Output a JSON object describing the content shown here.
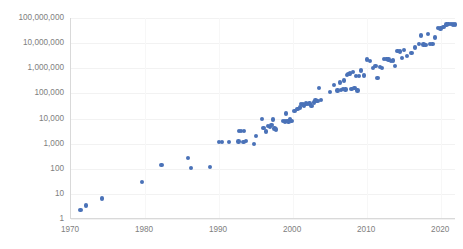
{
  "chart_data": {
    "type": "scatter",
    "title": "",
    "subtitle": "",
    "xlabel": "",
    "ylabel": "",
    "xlim": [
      1970,
      2022
    ],
    "ylim": [
      1,
      100000000
    ],
    "yscale": "log",
    "xscale": "linear",
    "grid": true,
    "legend": false,
    "legend_position": "none",
    "series_color": "#4a72b8",
    "marker": "circle",
    "xticks": [
      1970,
      1980,
      1990,
      2000,
      2010,
      2020
    ],
    "xtick_labels": [
      "1970",
      "1980",
      "1990",
      "2000",
      "2010",
      "2020"
    ],
    "yticks": [
      1,
      10,
      100,
      1000,
      10000,
      100000,
      1000000,
      10000000,
      100000000
    ],
    "ytick_labels": [
      "1",
      "10",
      "100",
      "1,000",
      "10,000",
      "100,000",
      "1,000,000",
      "10,000,000",
      "100,000,000"
    ],
    "series": [
      {
        "name": "series-1",
        "points": [
          [
            1971.3,
            2.3
          ],
          [
            1972.0,
            3.5
          ],
          [
            1974.2,
            6.5
          ],
          [
            1979.6,
            29
          ],
          [
            1982.2,
            140
          ],
          [
            1985.8,
            275
          ],
          [
            1986.2,
            110
          ],
          [
            1988.8,
            120
          ],
          [
            1990.0,
            1180
          ],
          [
            1990.4,
            1180
          ],
          [
            1991.3,
            1180
          ],
          [
            1992.6,
            1200
          ],
          [
            1992.7,
            3100
          ],
          [
            1993.0,
            3100
          ],
          [
            1993.3,
            1150
          ],
          [
            1993.4,
            3100
          ],
          [
            1993.6,
            1300
          ],
          [
            1994.7,
            950
          ],
          [
            1995.0,
            2000
          ],
          [
            1995.8,
            9800
          ],
          [
            1996.0,
            4200
          ],
          [
            1996.3,
            3000
          ],
          [
            1996.6,
            5100
          ],
          [
            1996.9,
            4500
          ],
          [
            1997.1,
            5600
          ],
          [
            1997.3,
            9200
          ],
          [
            1997.5,
            4000
          ],
          [
            1997.7,
            3700
          ],
          [
            1998.6,
            8000
          ],
          [
            1998.9,
            7600
          ],
          [
            1999.0,
            16000
          ],
          [
            1999.2,
            8000
          ],
          [
            1999.4,
            7600
          ],
          [
            1999.6,
            9000
          ],
          [
            1999.8,
            8000
          ],
          [
            2000.2,
            20000
          ],
          [
            2000.6,
            24000
          ],
          [
            2000.9,
            27000
          ],
          [
            2001.1,
            38000
          ],
          [
            2001.3,
            36000
          ],
          [
            2001.5,
            33000
          ],
          [
            2001.7,
            40000
          ],
          [
            2001.9,
            37000
          ],
          [
            2002.2,
            40000
          ],
          [
            2002.5,
            32000
          ],
          [
            2002.8,
            44000
          ],
          [
            2003.0,
            52000
          ],
          [
            2003.3,
            50000
          ],
          [
            2003.5,
            165000
          ],
          [
            2003.8,
            55000
          ],
          [
            2005.0,
            115000
          ],
          [
            2005.5,
            220000
          ],
          [
            2006.0,
            130000
          ],
          [
            2006.3,
            270000
          ],
          [
            2006.5,
            140000
          ],
          [
            2006.7,
            150000
          ],
          [
            2006.9,
            330000
          ],
          [
            2007.1,
            145000
          ],
          [
            2007.3,
            550000
          ],
          [
            2007.5,
            600000
          ],
          [
            2007.7,
            620000
          ],
          [
            2007.9,
            150000
          ],
          [
            2008.1,
            700000
          ],
          [
            2008.3,
            160000
          ],
          [
            2008.5,
            500000
          ],
          [
            2008.7,
            130000
          ],
          [
            2008.9,
            480000
          ],
          [
            2009.2,
            800000
          ],
          [
            2009.6,
            520000
          ],
          [
            2010.0,
            2200000
          ],
          [
            2010.4,
            1900000
          ],
          [
            2010.8,
            1000000
          ],
          [
            2011.1,
            1200000
          ],
          [
            2011.4,
            420000
          ],
          [
            2011.7,
            1100000
          ],
          [
            2012.0,
            1000000
          ],
          [
            2012.3,
            2400000
          ],
          [
            2012.6,
            2300000
          ],
          [
            2012.9,
            2200000
          ],
          [
            2013.2,
            1900000
          ],
          [
            2013.5,
            2000000
          ],
          [
            2013.8,
            1200000
          ],
          [
            2014.1,
            5000000
          ],
          [
            2014.4,
            4600000
          ],
          [
            2014.7,
            2500000
          ],
          [
            2015.0,
            5200000
          ],
          [
            2015.4,
            3000000
          ],
          [
            2016.0,
            4000000
          ],
          [
            2016.5,
            6800000
          ],
          [
            2017.0,
            9000000
          ],
          [
            2017.3,
            20000000
          ],
          [
            2017.6,
            8800000
          ],
          [
            2017.9,
            8600000
          ],
          [
            2018.2,
            23000000
          ],
          [
            2018.5,
            9000000
          ],
          [
            2018.8,
            9200000
          ],
          [
            2019.2,
            17000000
          ],
          [
            2019.6,
            40000000
          ],
          [
            2019.9,
            38000000
          ],
          [
            2020.3,
            45000000
          ],
          [
            2020.7,
            55000000
          ],
          [
            2021.0,
            58000000
          ],
          [
            2021.3,
            57000000
          ],
          [
            2021.6,
            56000000
          ],
          [
            2021.9,
            55000000
          ]
        ]
      }
    ]
  }
}
